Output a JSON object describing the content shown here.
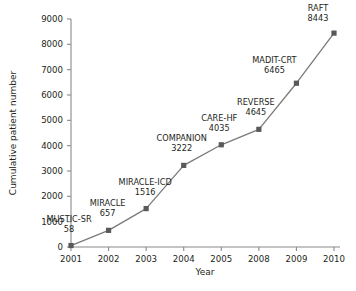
{
  "chart_data": {
    "type": "line",
    "title": "",
    "xlabel": "Year",
    "ylabel": "Cumulative patient number",
    "categories": [
      "2001",
      "2002",
      "2003",
      "2004",
      "2005",
      "2008",
      "2009",
      "2010"
    ],
    "values": [
      58,
      657,
      1516,
      3222,
      4035,
      4645,
      6465,
      8443
    ],
    "point_labels": [
      "MUSTIC-SR",
      "MIRACLE",
      "MIRACLE-ICD",
      "COMPANION",
      "CARE-HF",
      "REVERSE",
      "MADIT-CRT",
      "RAFT"
    ],
    "point_values_text": [
      "58",
      "657",
      "1516",
      "3222",
      "4035",
      "4645",
      "6465",
      "8443"
    ],
    "ylim": [
      0,
      9000
    ],
    "yticks": [
      "0",
      "1000",
      "2000",
      "3000",
      "4000",
      "5000",
      "6000",
      "7000",
      "8000",
      "9000"
    ],
    "ytick_values": [
      0,
      1000,
      2000,
      3000,
      4000,
      5000,
      6000,
      7000,
      8000,
      9000
    ],
    "grid": false,
    "legend": "none",
    "line_color": "#7a7a7a",
    "marker_color": "#58595b",
    "axis_color": "#8a8a8a",
    "background": "#ffffff"
  }
}
